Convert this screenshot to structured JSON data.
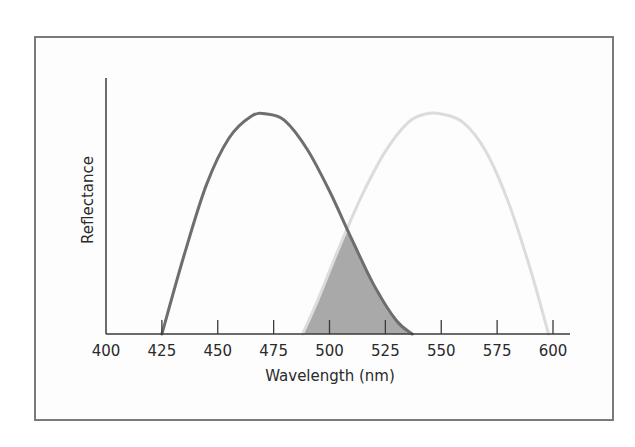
{
  "chart_data": {
    "type": "line",
    "title": "",
    "xlabel": "Wavelength (nm)",
    "ylabel": "Reflectance",
    "xlim": [
      400,
      610
    ],
    "ylim": [
      0,
      1.15
    ],
    "x_ticks": [
      400,
      425,
      450,
      475,
      500,
      525,
      550,
      575,
      600
    ],
    "y_ticks": [],
    "grid": false,
    "legend": null,
    "series": [
      {
        "name": "dark-curve",
        "color": "#6e6e6e",
        "x": [
          425,
          435,
          445,
          455,
          465,
          472,
          480,
          490,
          500,
          510,
          520,
          530,
          537
        ],
        "values": [
          0.0,
          0.36,
          0.68,
          0.89,
          0.99,
          1.0,
          0.97,
          0.84,
          0.65,
          0.43,
          0.22,
          0.06,
          0.0
        ]
      },
      {
        "name": "light-curve",
        "color": "#dcdcdc",
        "x": [
          488,
          495,
          505,
          515,
          525,
          535,
          543,
          550,
          560,
          570,
          580,
          590,
          598
        ],
        "values": [
          0.0,
          0.16,
          0.41,
          0.64,
          0.83,
          0.96,
          1.0,
          1.0,
          0.96,
          0.83,
          0.6,
          0.29,
          0.0
        ]
      }
    ],
    "annotations": [
      {
        "type": "shaded-overlap",
        "x_range": [
          488,
          537
        ],
        "color": "#a9a9a9",
        "description": "Overlap area under both curves"
      }
    ]
  },
  "labels": {
    "xlabel": "Wavelength (nm)",
    "ylabel": "Reflectance",
    "ticks": [
      "400",
      "425",
      "450",
      "475",
      "500",
      "525",
      "550",
      "575",
      "600"
    ]
  }
}
